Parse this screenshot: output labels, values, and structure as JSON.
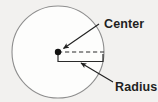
{
  "figure": {
    "type": "geometry-diagram",
    "background_color": "#f2f1ef",
    "labels": {
      "center": "Center",
      "radius": "Radius"
    },
    "parts": {
      "circle_name": "circle-outline",
      "center_point_name": "center-point",
      "radius_line_name": "radius-dashed-line",
      "radius_bracket_name": "radius-bracket"
    },
    "colors": {
      "circle_stroke": "#8e8e8e",
      "circle_fill": "#fdfdfc",
      "ink": "#1f1f1f",
      "dash_stroke": "#2a2a2a"
    },
    "geometry": {
      "circle_center_x": 58,
      "circle_center_y": 52,
      "circle_radius": 46,
      "center_dot_radius": 3,
      "radius_line_start_x": 58,
      "radius_line_start_y": 52,
      "radius_line_end_x": 104,
      "radius_line_end_y": 52
    },
    "annotations": [
      {
        "name": "center-callout",
        "label": "Center",
        "arrow_from_x": 99,
        "arrow_from_y": 24,
        "arrow_to_x": 62,
        "arrow_to_y": 49,
        "text_x": 106,
        "text_y": 24
      },
      {
        "name": "radius-callout",
        "label": "Radius",
        "arrow_from_x": 113,
        "arrow_from_y": 82,
        "arrow_to_x": 79,
        "arrow_to_y": 62,
        "text_x": 116,
        "text_y": 90
      }
    ]
  }
}
